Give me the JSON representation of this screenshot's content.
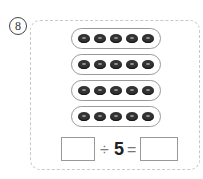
{
  "problem": {
    "number": "8",
    "groups": [
      5,
      5,
      5,
      5
    ],
    "equation": {
      "divide_sign": "÷",
      "divisor": "5",
      "equals_sign": "=",
      "dividend_answer": "",
      "quotient_answer": ""
    }
  }
}
